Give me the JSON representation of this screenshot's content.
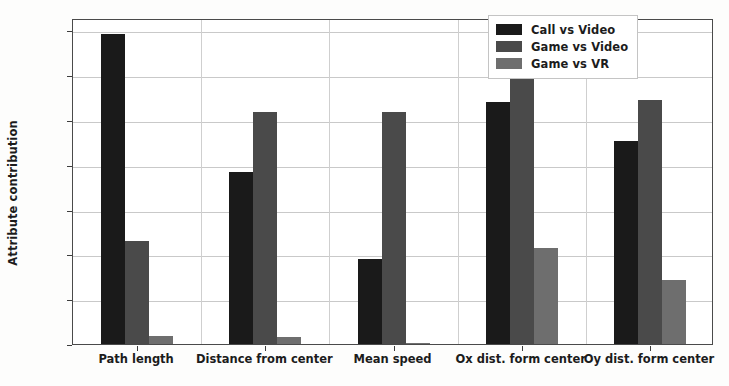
{
  "chart_data": {
    "type": "bar",
    "title": "",
    "xlabel": "",
    "ylabel": "Attribute contribution",
    "ylim": [
      0.0,
      0.7275
    ],
    "yticks": [
      "0.0",
      "0.1",
      "0.2",
      "0.3",
      "0.4",
      "0.5",
      "0.6",
      "0.7"
    ],
    "ytick_values": [
      0.0,
      0.1,
      0.2,
      0.3,
      0.4,
      0.5,
      0.6,
      0.7
    ],
    "grid": true,
    "legend_position": "upper right",
    "categories": [
      "Path length",
      "Distance from center",
      "Mean speed",
      "Ox dist. form center",
      "Oy dist. form center"
    ],
    "series": [
      {
        "name": "Call vs Video",
        "color": "#1a1a1a",
        "values": [
          0.692,
          0.384,
          0.19,
          0.54,
          0.452
        ]
      },
      {
        "name": "Game vs Video",
        "color": "#4a4a4a",
        "values": [
          0.23,
          0.518,
          0.518,
          0.688,
          0.545
        ]
      },
      {
        "name": "Game vs VR",
        "color": "#6e6e6e",
        "values": [
          0.017,
          0.016,
          0.003,
          0.215,
          0.143
        ]
      }
    ]
  },
  "figure": {
    "background": "#fdfdfc",
    "plot_background": "#ffffff",
    "frame_color": "#4a4a4a",
    "grid_color": "#c9c9c9"
  }
}
